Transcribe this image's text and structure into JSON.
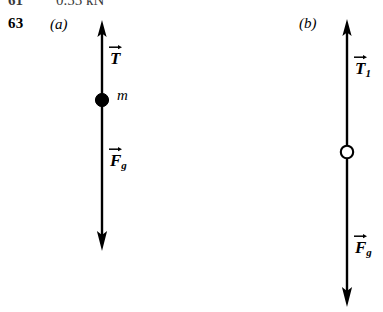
{
  "page": {
    "previous_answer": {
      "number": "61",
      "value": "0.55 kN"
    },
    "problem_number": "63"
  },
  "figure": {
    "type": "free-body-diagram",
    "panels": [
      {
        "id": "a",
        "label": "(a)",
        "body_marker": "filled-dot",
        "body_marker_color": "#000000",
        "mass_label": "m",
        "vectors": [
          {
            "name": "tension",
            "symbol": "T",
            "subscript": "",
            "direction": "up",
            "label": "T"
          },
          {
            "name": "gravity",
            "symbol": "F",
            "subscript": "g",
            "direction": "down",
            "label": "F"
          }
        ]
      },
      {
        "id": "b",
        "label": "(b)",
        "body_marker": "open-circle",
        "body_marker_color": "#ffffff",
        "mass_label": "",
        "vectors": [
          {
            "name": "tension-1",
            "symbol": "T",
            "subscript": "1",
            "direction": "up",
            "label": "T"
          },
          {
            "name": "gravity",
            "symbol": "F",
            "subscript": "g",
            "direction": "down",
            "label": "F"
          }
        ]
      }
    ]
  },
  "style": {
    "ink": "#000000",
    "paper": "#ffffff"
  }
}
